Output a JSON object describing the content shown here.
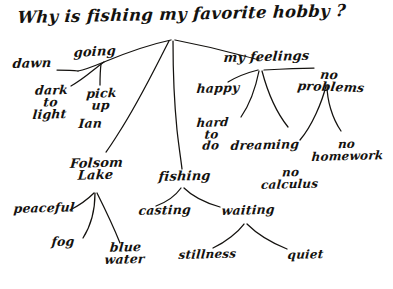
{
  "diagram": {
    "kind": "hand-drawn-mind-map",
    "ink_color": "#14120f",
    "background_color": "#ffffff",
    "title": "Why is fishing my favorite hobby ?",
    "nodes": {
      "title": "Why is fishing my favorite hobby ?",
      "dawn": "dawn",
      "going": "going",
      "dark_to_light": "dark\nto\nlight",
      "pick_up": "pick\nup",
      "ian": "Ian",
      "folsom_lake": "Folsom\nLake",
      "peaceful": "peaceful",
      "fog": "fog",
      "blue_water": "blue\nwater",
      "fishing": "fishing",
      "casting": "casting",
      "waiting": "waiting",
      "stillness": "stillness",
      "quiet": "quiet",
      "my_feelings": "my feelings",
      "happy": "happy",
      "hard_to_do": "hard\nto\ndo",
      "dreaming": "dreaming",
      "no_problems": "no\nproblems",
      "no_homework": "no\nhomework",
      "no_calculus": "no\ncalculus"
    },
    "branches": [
      {
        "from": "title",
        "to": "going"
      },
      {
        "from": "title",
        "to": "folsom_lake"
      },
      {
        "from": "title",
        "to": "fishing"
      },
      {
        "from": "title",
        "to": "my_feelings"
      },
      {
        "from": "going",
        "to": "dawn"
      },
      {
        "from": "going",
        "to": "dark_to_light"
      },
      {
        "from": "going",
        "to": "pick_up"
      },
      {
        "from": "folsom_lake",
        "to": "peaceful"
      },
      {
        "from": "folsom_lake",
        "to": "fog"
      },
      {
        "from": "folsom_lake",
        "to": "blue_water"
      },
      {
        "from": "fishing",
        "to": "casting"
      },
      {
        "from": "fishing",
        "to": "waiting"
      },
      {
        "from": "waiting",
        "to": "stillness"
      },
      {
        "from": "waiting",
        "to": "quiet"
      },
      {
        "from": "my_feelings",
        "to": "happy"
      },
      {
        "from": "my_feelings",
        "to": "hard_to_do"
      },
      {
        "from": "my_feelings",
        "to": "dreaming"
      },
      {
        "from": "my_feelings",
        "to": "no_problems"
      },
      {
        "from": "no_problems",
        "to": "no_homework"
      },
      {
        "from": "no_problems",
        "to": "no_calculus"
      }
    ]
  }
}
